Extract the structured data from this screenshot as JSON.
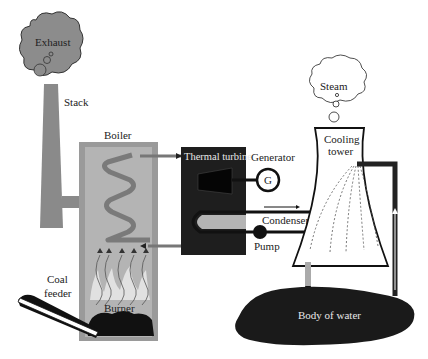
{
  "labels": {
    "exhaust": "Exhaust",
    "stack": "Stack",
    "boiler": "Boiler",
    "thermal_turbine": "Thermal turbine",
    "generator": "Generator",
    "generator_symbol": "G",
    "condenser": "Condenser",
    "pump": "Pump",
    "steam": "Steam",
    "cooling_tower_line1": "Cooling",
    "cooling_tower_line2": "tower",
    "coal_feeder_line1": "Coal",
    "coal_feeder_line2": "feeder",
    "burner": "Burner",
    "body_of_water": "Body of water"
  },
  "colors": {
    "stack_gray": "#8a8a8a",
    "boiler_outer": "#9a9a9a",
    "boiler_inner": "#b4b4b4",
    "turbine_dark": "#1e1e1e",
    "water_dark": "#1a1a1a",
    "coil_gray": "#7a7a7a"
  }
}
